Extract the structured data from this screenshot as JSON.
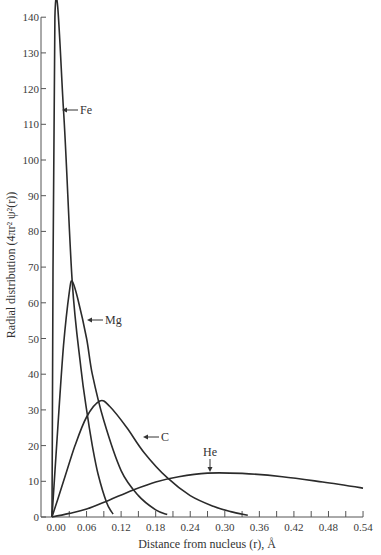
{
  "chart_data": {
    "type": "line",
    "title": "",
    "xlabel": "Distance from nucleus (r), Å",
    "ylabel": "Radial distribution (4πr² ψ²(r))",
    "xlim": [
      0,
      0.54
    ],
    "ylim": [
      0,
      140
    ],
    "grid": false,
    "legend": "inline labels with arrows",
    "x_ticks": [
      0.0,
      0.06,
      0.12,
      0.18,
      0.24,
      0.3,
      0.36,
      0.42,
      0.48,
      0.54
    ],
    "x_tick_labels": [
      "0.00",
      "0.06",
      "0.12",
      "0.18",
      "0.24",
      "0.30",
      "0.36",
      "0.42",
      "0.48",
      "0.54"
    ],
    "x_minor_step": 0.03,
    "y_ticks": [
      0,
      10,
      20,
      30,
      40,
      50,
      60,
      70,
      80,
      90,
      100,
      110,
      120,
      130,
      140
    ],
    "y_tick_labels": [
      "0",
      "10",
      "20",
      "30",
      "40",
      "50",
      "60",
      "70",
      "80",
      "90",
      "100",
      "110",
      "120",
      "130",
      "140"
    ],
    "series": [
      {
        "name": "Fe",
        "peak": [
          0.005,
          140
        ],
        "points": [
          [
            0,
            0
          ],
          [
            0.005,
            140
          ],
          [
            0.02,
            114
          ],
          [
            0.035,
            66
          ],
          [
            0.05,
            42
          ],
          [
            0.06,
            30
          ],
          [
            0.07,
            20
          ],
          [
            0.08,
            12
          ],
          [
            0.095,
            4
          ],
          [
            0.106,
            0.8
          ]
        ]
      },
      {
        "name": "Mg",
        "peak": [
          0.035,
          66
        ],
        "points": [
          [
            0,
            0
          ],
          [
            0.01,
            25
          ],
          [
            0.02,
            48
          ],
          [
            0.03,
            63
          ],
          [
            0.035,
            66
          ],
          [
            0.045,
            61
          ],
          [
            0.06,
            50
          ],
          [
            0.07,
            40
          ],
          [
            0.09,
            27
          ],
          [
            0.12,
            13
          ],
          [
            0.15,
            6
          ],
          [
            0.18,
            2
          ],
          [
            0.2,
            0.7
          ]
        ]
      },
      {
        "name": "C",
        "peak": [
          0.083,
          32.5
        ],
        "points": [
          [
            0,
            0
          ],
          [
            0.02,
            10
          ],
          [
            0.04,
            20
          ],
          [
            0.06,
            28
          ],
          [
            0.083,
            32.5
          ],
          [
            0.1,
            31
          ],
          [
            0.13,
            25
          ],
          [
            0.16,
            18
          ],
          [
            0.2,
            11
          ],
          [
            0.24,
            6
          ],
          [
            0.28,
            3
          ],
          [
            0.31,
            1.5
          ],
          [
            0.34,
            0.5
          ]
        ]
      },
      {
        "name": "He",
        "peak": [
          0.28,
          12.3
        ],
        "points": [
          [
            0,
            0
          ],
          [
            0.03,
            1
          ],
          [
            0.06,
            2.2
          ],
          [
            0.1,
            4.8
          ],
          [
            0.14,
            7.5
          ],
          [
            0.18,
            9.8
          ],
          [
            0.22,
            11.3
          ],
          [
            0.27,
            12.3
          ],
          [
            0.33,
            12.2
          ],
          [
            0.4,
            11.3
          ],
          [
            0.47,
            9.8
          ],
          [
            0.54,
            8.1
          ]
        ]
      }
    ],
    "annotations": [
      {
        "text": "Fe",
        "at": [
          0.02,
          114
        ],
        "arrow": "left"
      },
      {
        "text": "Mg",
        "at": [
          0.085,
          55
        ],
        "arrow": "left"
      },
      {
        "text": "C",
        "at": [
          0.16,
          22
        ],
        "arrow": "left"
      },
      {
        "text": "He",
        "at": [
          0.275,
          12.3
        ],
        "arrow": "down"
      }
    ]
  },
  "labels": {
    "xlabel": "Distance from nucleus (r), Å",
    "ylabel": "Radial distribution (4πr² ψ²(r))",
    "fe": "Fe",
    "mg": "Mg",
    "c": "C",
    "he": "He"
  }
}
